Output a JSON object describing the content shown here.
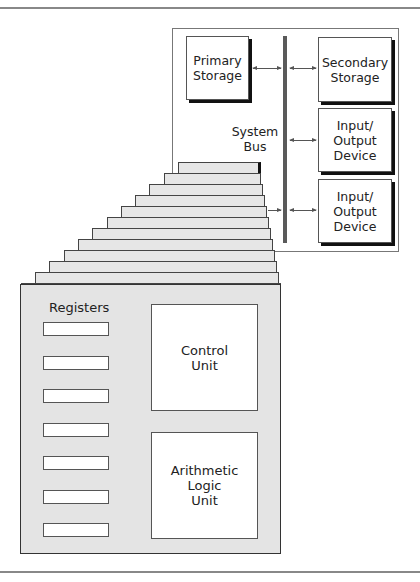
{
  "diagram": {
    "system": {
      "primary_storage": "Primary\nStorage",
      "secondary_storage": "Secondary\nStorage",
      "io_device_1": "Input/\nOutput\nDevice",
      "io_device_2": "Input/\nOutput\nDevice",
      "bus_label": "System\nBus"
    },
    "cpu": {
      "registers_label": "Registers",
      "register_count": 7,
      "control_unit": "Control\nUnit",
      "alu": "Arithmetic\nLogic\nUnit",
      "stack_layers": 12
    },
    "colors": {
      "bus": "#5a5a5a",
      "layer_fill": "#e6e6e6",
      "box_fill": "#ffffff",
      "rule": "#888888"
    }
  }
}
